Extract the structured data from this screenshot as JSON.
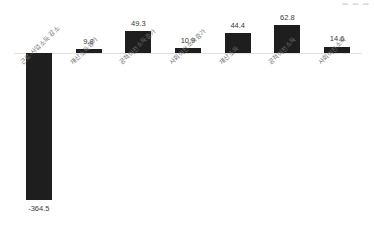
{
  "top_fragment": "▬ ▬ ▬",
  "chart_data": {
    "type": "bar",
    "title": "",
    "subtitle": "",
    "xlabel": "",
    "ylabel": "",
    "grid": false,
    "legend": "none",
    "baseline_value": 0,
    "ylim": [
      -380,
      80
    ],
    "categories": [
      "근로·사업소득 감소",
      "재산소득증가",
      "공적이전소득증가",
      "사회이전소득증가",
      "재산소득",
      "공적이전소득",
      "사회이전소득"
    ],
    "values": [
      -364.5,
      9.8,
      49.3,
      10.9,
      44.4,
      62.8,
      14.6
    ],
    "value_labels": [
      "-364.5",
      "9.8",
      "49.3",
      "10.9",
      "44.4",
      "62.8",
      "14.6"
    ],
    "bar_color": "#1e1e1e",
    "baseline_color": "#e2e2e2"
  }
}
